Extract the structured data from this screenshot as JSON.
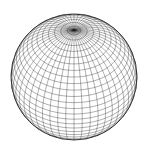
{
  "figure": {
    "type": "wireframe-sphere",
    "background": "#ffffff",
    "line_color": "#1a1a1a",
    "center": [
      74,
      77
    ],
    "radius": 63,
    "view_elevation_deg": 42,
    "meridians": 48,
    "parallels": 30
  }
}
